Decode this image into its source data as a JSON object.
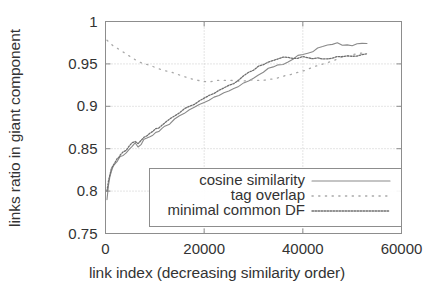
{
  "chart_data": {
    "type": "line",
    "title": "",
    "xlabel": "link index (decreasing similarity order)",
    "ylabel": "links ratio in giant component",
    "xlim": [
      0,
      60000
    ],
    "ylim": [
      0.75,
      1
    ],
    "xticks": [
      "0",
      "20000",
      "40000",
      "60000"
    ],
    "xtick_values": [
      0,
      20000,
      40000,
      60000
    ],
    "yticks": [
      "0.75",
      "0.8",
      "0.85",
      "0.9",
      "0.95",
      "1"
    ],
    "ytick_values": [
      0.75,
      0.8,
      0.85,
      0.9,
      0.95,
      1
    ],
    "grid": true,
    "legend_position": "lower center",
    "series": [
      {
        "name": "cosine similarity",
        "style": "solid",
        "color": "#8a8a8a",
        "x": [
          300,
          600,
          900,
          1200,
          1500,
          1800,
          2100,
          2400,
          2700,
          3000,
          3600,
          4200,
          4800,
          5400,
          6000,
          6600,
          7200,
          7800,
          8400,
          9000,
          9600,
          10200,
          10800,
          11400,
          12000,
          13000,
          14000,
          15000,
          16000,
          17000,
          18000,
          19000,
          20000,
          21000,
          22000,
          23000,
          24000,
          25000,
          26000,
          27000,
          28000,
          29000,
          30000,
          31000,
          32000,
          33000,
          34000,
          35000,
          36000,
          37000,
          38000,
          39000,
          40000,
          41000,
          42000,
          43000,
          44000,
          45000,
          46000,
          47000,
          48000,
          49000,
          50000,
          51000,
          52000,
          53000
        ],
        "y": [
          0.79,
          0.806,
          0.818,
          0.824,
          0.828,
          0.831,
          0.834,
          0.836,
          0.838,
          0.84,
          0.843,
          0.845,
          0.848,
          0.852,
          0.857,
          0.851,
          0.855,
          0.86,
          0.862,
          0.864,
          0.866,
          0.869,
          0.871,
          0.873,
          0.876,
          0.88,
          0.884,
          0.888,
          0.892,
          0.896,
          0.899,
          0.902,
          0.905,
          0.908,
          0.911,
          0.913,
          0.916,
          0.918,
          0.921,
          0.924,
          0.927,
          0.93,
          0.933,
          0.937,
          0.941,
          0.944,
          0.946,
          0.948,
          0.949,
          0.952,
          0.956,
          0.96,
          0.962,
          0.963,
          0.965,
          0.968,
          0.971,
          0.973,
          0.974,
          0.974,
          0.973,
          0.972,
          0.972,
          0.973,
          0.974,
          0.974
        ]
      },
      {
        "name": "tag overlap",
        "style": "dotted-sparse",
        "color": "#a8a8a8",
        "x": [
          300,
          1500,
          3000,
          4500,
          6000,
          7500,
          9000,
          10500,
          12000,
          13500,
          15000,
          16500,
          18000,
          19500,
          21000,
          22500,
          24000,
          25500,
          27000,
          28500,
          30000,
          31500,
          33000,
          34500,
          36000,
          37500,
          39000,
          40500,
          42000,
          43500,
          45000,
          46500,
          48000,
          49500,
          51000,
          52500,
          53000
        ],
        "y": [
          0.978,
          0.972,
          0.966,
          0.96,
          0.955,
          0.951,
          0.948,
          0.945,
          0.942,
          0.94,
          0.937,
          0.934,
          0.932,
          0.93,
          0.929,
          0.93,
          0.931,
          0.93,
          0.929,
          0.93,
          0.931,
          0.93,
          0.931,
          0.933,
          0.935,
          0.937,
          0.94,
          0.943,
          0.946,
          0.949,
          0.952,
          0.955,
          0.958,
          0.96,
          0.962,
          0.963,
          0.963
        ]
      },
      {
        "name": "minimal common DF",
        "style": "dotted-dense",
        "color": "#6f6f6f",
        "x": [
          300,
          600,
          900,
          1200,
          1500,
          1800,
          2100,
          2400,
          2700,
          3000,
          3600,
          4200,
          4800,
          5400,
          6000,
          6600,
          7200,
          7800,
          8400,
          9000,
          9600,
          10200,
          10800,
          11400,
          12000,
          13000,
          14000,
          15000,
          16000,
          17000,
          18000,
          19000,
          20000,
          21000,
          22000,
          23000,
          24000,
          25000,
          26000,
          27000,
          28000,
          29000,
          30000,
          31000,
          32000,
          33000,
          34000,
          35000,
          36000,
          37000,
          38000,
          39000,
          40000,
          41000,
          42000,
          43000,
          44000,
          45000,
          46000,
          47000,
          48000,
          49000,
          50000,
          51000,
          52000,
          53000
        ],
        "y": [
          0.8,
          0.812,
          0.82,
          0.826,
          0.83,
          0.833,
          0.836,
          0.838,
          0.84,
          0.843,
          0.846,
          0.849,
          0.852,
          0.856,
          0.859,
          0.857,
          0.86,
          0.864,
          0.866,
          0.868,
          0.871,
          0.873,
          0.875,
          0.878,
          0.881,
          0.885,
          0.889,
          0.893,
          0.897,
          0.9,
          0.903,
          0.906,
          0.909,
          0.912,
          0.915,
          0.918,
          0.921,
          0.924,
          0.927,
          0.931,
          0.935,
          0.939,
          0.943,
          0.947,
          0.95,
          0.953,
          0.955,
          0.957,
          0.958,
          0.958,
          0.957,
          0.957,
          0.958,
          0.958,
          0.957,
          0.956,
          0.956,
          0.957,
          0.957,
          0.958,
          0.958,
          0.959,
          0.959,
          0.96,
          0.961,
          0.962
        ]
      }
    ]
  },
  "axes": {
    "y_title": "links ratio in giant component",
    "x_title": "link index (decreasing similarity order)"
  },
  "legend": {
    "entries": [
      {
        "label": "cosine similarity"
      },
      {
        "label": "tag overlap"
      },
      {
        "label": "minimal common DF"
      }
    ]
  }
}
